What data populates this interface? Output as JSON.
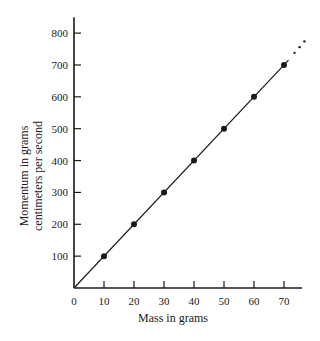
{
  "chart_data": {
    "type": "line",
    "title": "",
    "xlabel": "Mass in grams",
    "ylabel_lines": [
      "Momentum in grams",
      "centimeters per second"
    ],
    "ylabel": "Momentum in grams centimeters per second",
    "x": [
      10,
      20,
      30,
      40,
      50,
      60,
      70
    ],
    "series": [
      {
        "name": "Momentum",
        "values": [
          100,
          200,
          300,
          400,
          500,
          600,
          700
        ],
        "markers": true,
        "line_through_origin": true,
        "extrapolation_dots": true
      }
    ],
    "xticks": [
      0,
      10,
      20,
      30,
      40,
      50,
      60,
      70
    ],
    "yticks": [
      100,
      200,
      300,
      400,
      500,
      600,
      700,
      800
    ],
    "xlim": [
      0,
      76
    ],
    "ylim": [
      0,
      850
    ],
    "grid": false,
    "legend": "none"
  }
}
